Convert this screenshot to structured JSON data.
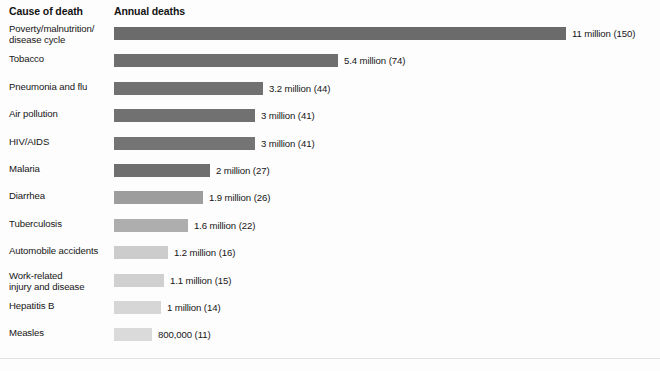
{
  "header": {
    "cause_label": "Cause of death",
    "deaths_label": "Annual deaths"
  },
  "chart_data": {
    "type": "bar",
    "title": "",
    "xlabel": "Annual deaths",
    "ylabel": "Cause of death",
    "orientation": "horizontal",
    "grid": false,
    "legend": "none",
    "xlim": [
      0,
      11
    ],
    "unit": "millions of deaths per year",
    "categories": [
      "Poverty/malnutrition/ disease cycle",
      "Tobacco",
      "Pneumonia and flu",
      "Air pollution",
      "HIV/AIDS",
      "Malaria",
      "Diarrhea",
      "Tuberculosis",
      "Automobile accidents",
      "Work-related injury and disease",
      "Hepatitis B",
      "Measles"
    ],
    "values": [
      11,
      5.4,
      3.2,
      3,
      3,
      2,
      1.9,
      1.6,
      1.2,
      1.1,
      1,
      0.8
    ],
    "secondary_values": [
      150,
      74,
      44,
      41,
      41,
      27,
      26,
      22,
      16,
      15,
      14,
      11
    ],
    "value_labels": [
      "11 million (150)",
      "5.4  million (74)",
      "3.2 million (44)",
      "3 million (41)",
      "3 million (41)",
      "2 million (27)",
      "1.9 million (26)",
      "1.6 million (22)",
      "1.2 million (16)",
      "1.1 million (15)",
      "1 million (14)",
      "800,000 (11)"
    ]
  },
  "rows": [
    {
      "label_line1": "Poverty/malnutrition/",
      "label_line2": "disease cycle",
      "value_label": "11 million (150)",
      "bar_width_px": 452,
      "color": "#6b6b6b"
    },
    {
      "label_line1": "Tobacco",
      "label_line2": "",
      "value_label": "5.4  million (74)",
      "bar_width_px": 224,
      "color": "#6e6e6e"
    },
    {
      "label_line1": "Pneumonia and flu",
      "label_line2": "",
      "value_label": "3.2 million (44)",
      "bar_width_px": 149,
      "color": "#717171"
    },
    {
      "label_line1": "Air pollution",
      "label_line2": "",
      "value_label": "3 million (41)",
      "bar_width_px": 141,
      "color": "#717171"
    },
    {
      "label_line1": "HIV/AIDS",
      "label_line2": "",
      "value_label": "3 million (41)",
      "bar_width_px": 141,
      "color": "#747474"
    },
    {
      "label_line1": "Malaria",
      "label_line2": "",
      "value_label": "2 million (27)",
      "bar_width_px": 96,
      "color": "#6f6f6f"
    },
    {
      "label_line1": "Diarrhea",
      "label_line2": "",
      "value_label": "1.9 million (26)",
      "bar_width_px": 89,
      "color": "#9d9d9d"
    },
    {
      "label_line1": "Tuberculosis",
      "label_line2": "",
      "value_label": "1.6 million (22)",
      "bar_width_px": 74,
      "color": "#aeaeae"
    },
    {
      "label_line1": "Automobile accidents",
      "label_line2": "",
      "value_label": "1.2 million (16)",
      "bar_width_px": 54,
      "color": "#cccccc"
    },
    {
      "label_line1": "Work-related",
      "label_line2": "injury and disease",
      "value_label": "1.1 million (15)",
      "bar_width_px": 50,
      "color": "#d0d0d0"
    },
    {
      "label_line1": "Hepatitis B",
      "label_line2": "",
      "value_label": "1 million (14)",
      "bar_width_px": 47,
      "color": "#d6d6d6"
    },
    {
      "label_line1": "Measles",
      "label_line2": "",
      "value_label": "800,000 (11)",
      "bar_width_px": 38,
      "color": "#dadada"
    }
  ]
}
